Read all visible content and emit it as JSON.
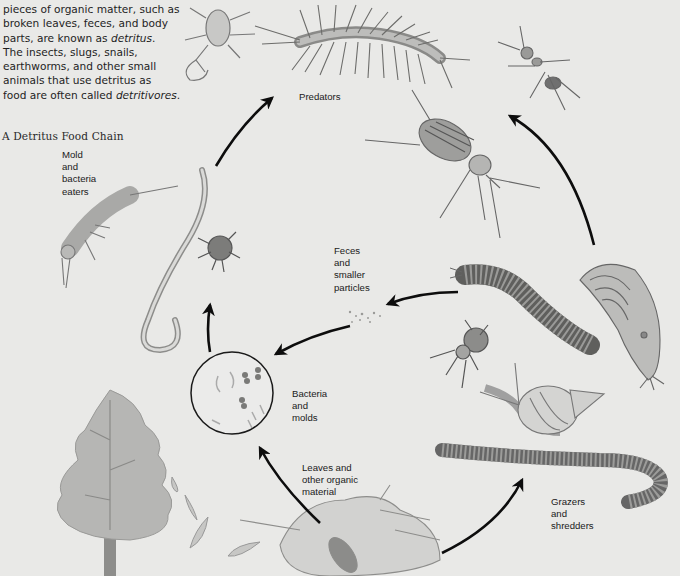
{
  "intro": {
    "line1": "pieces of organic matter, such as",
    "line2": "broken leaves, feces, and body",
    "line3_pre": "parts, are known as ",
    "line3_em": "detritus",
    "line3_post": ".",
    "line4": "The insects, slugs, snails,",
    "line5": "earthworms, and other small",
    "line6": "animals that use detritus as",
    "line7_pre": "food are often called ",
    "line7_em": "detritivores",
    "line7_post": "."
  },
  "figure": {
    "title": "A Detritus Food Chain",
    "labels": {
      "predators": "Predators",
      "mold_eaters": "Mold\nand\nbacteria\neaters",
      "feces": "Feces\nand\nsmaller\nparticles",
      "bacteria": "Bacteria\nand\nmolds",
      "leaves": "Leaves and\nother organic\nmaterial",
      "grazers": "Grazers\nand\nshredders"
    },
    "organisms": [
      "pseudoscorpion",
      "centipede",
      "ant",
      "ground-beetle",
      "springtail",
      "nematode-worm",
      "mite",
      "millipede",
      "slug",
      "mite",
      "snail",
      "earthworm",
      "tree",
      "falling-leaves",
      "leaf-litter",
      "beetle",
      "bacteria-circle",
      "feces-particles"
    ],
    "colors": {
      "background": "#e9e9e7",
      "arrow": "#0d0d0d",
      "text": "#1a1a1a",
      "illustration": "#8a8a88"
    }
  }
}
